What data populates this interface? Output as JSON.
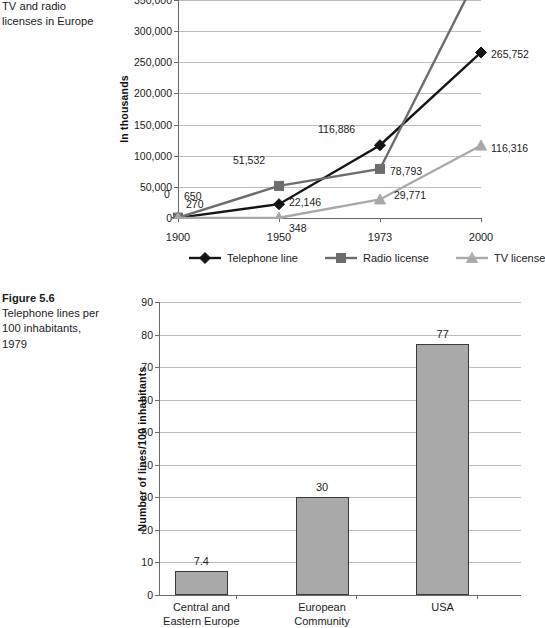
{
  "figure_top": {
    "caption_lines": [
      "of telephone lines,",
      "TV and radio",
      "licenses in Europe"
    ]
  },
  "figure_bottom": {
    "number": "Figure 5.6",
    "caption_lines": [
      "Telephone lines per",
      "100 inhabitants,",
      "1979"
    ]
  },
  "chart_data": [
    {
      "type": "line",
      "title": "",
      "xlabel": "",
      "ylabel": "In thousands",
      "x": [
        "1900",
        "1950",
        "1973",
        "2000"
      ],
      "ylim": [
        0,
        350000
      ],
      "yticks": [
        0,
        50000,
        100000,
        150000,
        200000,
        250000,
        300000,
        350000
      ],
      "ytick_labels": [
        "0",
        "50,000",
        "100,000",
        "150,000",
        "200,000",
        "250,000",
        "300,000",
        "350,000"
      ],
      "grid": true,
      "legend_position": "bottom",
      "series": [
        {
          "name": "Telephone line",
          "color": "#151515",
          "marker": "diamond",
          "values": [
            270,
            22146,
            116886,
            265752
          ],
          "labels": [
            "270",
            "22,146",
            "116,886",
            "265,752"
          ]
        },
        {
          "name": "Radio license",
          "color": "#6d6d6d",
          "marker": "square",
          "values": [
            650,
            51532,
            78793,
            400000
          ],
          "labels": [
            "650",
            "51,532",
            "78,793",
            ""
          ]
        },
        {
          "name": "TV license",
          "color": "#a9a9a9",
          "marker": "triangle",
          "values": [
            0,
            348,
            29771,
            116316
          ],
          "labels": [
            "0",
            "348",
            "29,771",
            "116,316"
          ]
        }
      ]
    },
    {
      "type": "bar",
      "title": "",
      "xlabel": "",
      "ylabel": "Number of lines/100 inhabitants",
      "categories": [
        "Central and\nEastern Europe",
        "European\nCommunity",
        "USA"
      ],
      "values": [
        7.4,
        30,
        77
      ],
      "value_labels": [
        "7.4",
        "30",
        "77"
      ],
      "ylim": [
        0,
        90
      ],
      "yticks": [
        0,
        10,
        20,
        30,
        40,
        50,
        60,
        70,
        80,
        90
      ],
      "ytick_labels": [
        "0",
        "10",
        "20",
        "30",
        "40",
        "50",
        "60",
        "70",
        "80",
        "90"
      ],
      "grid": true,
      "bar_color": "#a9a9a9",
      "bar_border": "#3a3a3a"
    }
  ]
}
